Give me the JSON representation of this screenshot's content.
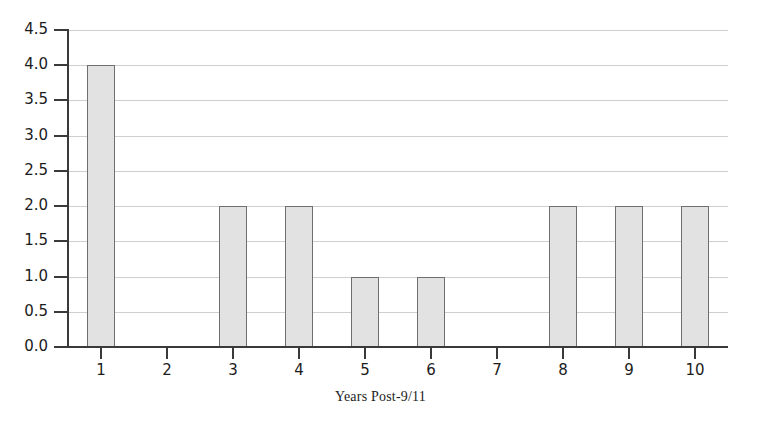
{
  "chart_data": {
    "type": "bar",
    "title": "",
    "subtitle": "",
    "xlabel": "Years Post-9/11",
    "ylabel": "",
    "categories": [
      "1",
      "2",
      "3",
      "4",
      "5",
      "6",
      "7",
      "8",
      "9",
      "10"
    ],
    "values": [
      4.0,
      0.0,
      2.0,
      2.0,
      1.0,
      1.0,
      0.0,
      2.0,
      2.0,
      2.0
    ],
    "ylim": [
      0.0,
      4.5
    ],
    "ytick_labels": [
      "0.0",
      "0.5",
      "1.0",
      "1.5",
      "2.0",
      "2.5",
      "3.0",
      "3.5",
      "4.0",
      "4.5"
    ],
    "ytick_values": [
      0.0,
      0.5,
      1.0,
      1.5,
      2.0,
      2.5,
      3.0,
      3.5,
      4.0,
      4.5
    ],
    "grid": true,
    "grid_axis": "y",
    "legend": false,
    "legend_position": "none",
    "colors": {
      "bar_fill": "#e2e2e2",
      "bar_border": "#6f6f6f",
      "gridline": "#cfcfcf",
      "axis": "#3a3a3a",
      "text": "#1c1c1c",
      "background": "#ffffff"
    }
  }
}
